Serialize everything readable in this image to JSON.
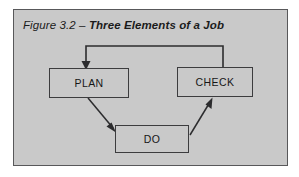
{
  "figure": {
    "caption_label": "Figure 3.2 – ",
    "caption_title": "Three Elements of a Job",
    "frame_color": "#58585a",
    "background_color": "#c9c9c9",
    "line_color": "#2c2c2e"
  },
  "diagram": {
    "type": "flow-cycle",
    "nodes": [
      {
        "id": "plan",
        "label": "PLAN"
      },
      {
        "id": "do",
        "label": "DO"
      },
      {
        "id": "check",
        "label": "CHECK"
      }
    ],
    "edges": [
      {
        "from": "plan",
        "to": "do",
        "style": "diagonal-arrow"
      },
      {
        "from": "do",
        "to": "check",
        "style": "diagonal-arrow"
      },
      {
        "from": "check",
        "to": "plan",
        "style": "orthogonal-feedback-arrow"
      }
    ]
  }
}
